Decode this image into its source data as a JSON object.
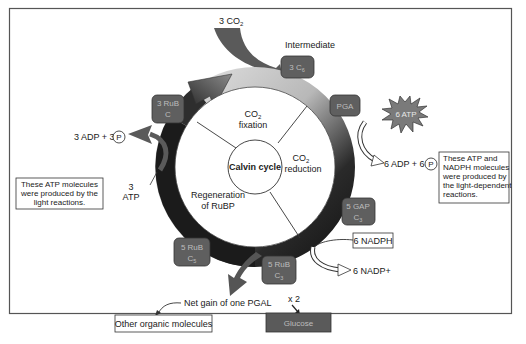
{
  "diagram": {
    "title": "Calvin cycle",
    "phases": {
      "fixation": [
        "CO",
        "2",
        "fixation"
      ],
      "reduction": [
        "CO",
        "2",
        "reduction"
      ],
      "regeneration": [
        "Regeneration",
        "of RuBP"
      ]
    },
    "inputs": {
      "co2": {
        "prefix": "3 CO",
        "sub": "2"
      },
      "atp_left": {
        "line1": "3",
        "line2": "ATP"
      },
      "atp_right": "6 ATP",
      "nadph": "6 NADPH"
    },
    "outputs": {
      "adp_left": {
        "text": "3 ADP + 3",
        "circle": "P"
      },
      "adp_right": {
        "text": "6 ADP + 6",
        "circle": "P"
      },
      "nadp": "6 NADP+",
      "net_gain": "Net gain of one PGAL",
      "multiplier": "x 2",
      "other": "Other organic molecules",
      "glucose": "Glucose"
    },
    "intermediate_label": "Intermediate",
    "molecules": [
      {
        "id": "3c6",
        "line1": "3 C",
        "sub": "6"
      },
      {
        "id": "pga",
        "line1": "PGA"
      },
      {
        "id": "3rub",
        "line1": "3 RuB",
        "line2": "C"
      },
      {
        "id": "5gap",
        "line1": "5 GAP",
        "line2": "C",
        "sub": "3"
      },
      {
        "id": "5rub-bottom",
        "line1": "5 RuB",
        "line2": "C",
        "sub": "3"
      },
      {
        "id": "5rub-left",
        "line1": "5 RuB",
        "line2": "C",
        "sub": "5"
      }
    ],
    "notes": {
      "left": [
        "These ATP molecules",
        "were produced by the",
        "light reactions."
      ],
      "right": [
        "These ATP and",
        "NADPH molecules",
        "were produced by",
        "the light-dependent",
        "reactions."
      ]
    },
    "colors": {
      "molecule_fill": "#5f5f5f",
      "ring_dark": "#1c1c1c",
      "ring_light": "#d6d6d6",
      "arrow_gray": "#6b6b6b",
      "frame": "#555555"
    }
  }
}
